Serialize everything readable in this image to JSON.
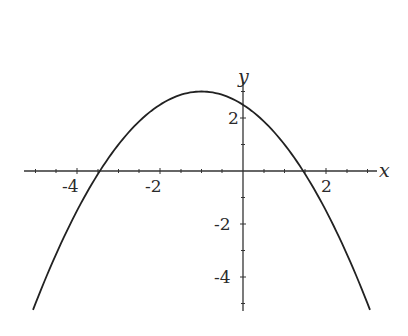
{
  "chart_data": {
    "type": "line",
    "title": "",
    "xlabel": "x",
    "ylabel": "y",
    "function": "y = 3 - (x+1)^2 / 2",
    "xlim": [
      -5.28,
      3.23
    ],
    "ylim": [
      -5.3,
      3.5
    ],
    "grid": false,
    "legend": null,
    "x_ticks": [
      -4,
      -2,
      2
    ],
    "x_tick_labels": [
      "-4",
      "-2",
      "2"
    ],
    "y_ticks": [
      2,
      -2,
      -4
    ],
    "y_tick_labels": [
      "2",
      "-2",
      "-4"
    ],
    "series": [
      {
        "name": "parabola",
        "x": [
          -5.06,
          -4.5,
          -4,
          -3.5,
          -3,
          -2.5,
          -2,
          -1.5,
          -1,
          -0.5,
          0,
          0.5,
          1,
          1.5,
          2,
          2.5,
          3.06
        ],
        "y": [
          -5.24,
          -3.13,
          -1.5,
          -0.13,
          1.0,
          1.88,
          2.5,
          2.88,
          3.0,
          2.88,
          2.5,
          1.88,
          1.0,
          -0.13,
          -1.5,
          -3.13,
          -5.24
        ]
      }
    ],
    "annotations": {
      "vertex": [
        -1,
        3
      ],
      "roots": [
        -3.45,
        1.45
      ],
      "y_intercept": 2.5
    }
  },
  "labels": {
    "x_axis": "x",
    "y_axis": "y",
    "x_tick_neg4": "-4",
    "x_tick_neg2": "-2",
    "x_tick_2": "2",
    "y_tick_2": "2",
    "y_tick_neg2": "-2",
    "y_tick_neg4": "-4"
  }
}
